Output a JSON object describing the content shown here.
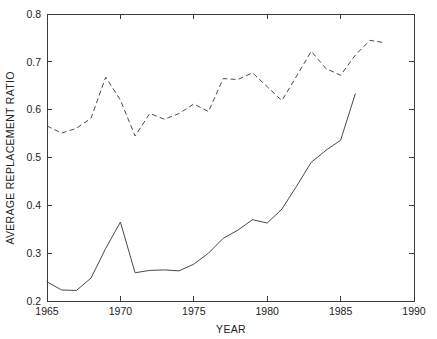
{
  "chart_data": {
    "type": "line",
    "title": "",
    "xlabel": "YEAR",
    "ylabel": "AVERAGE REPLACEMENT RATIO",
    "xlim": [
      1965,
      1990
    ],
    "ylim": [
      0.2,
      0.8
    ],
    "grid": false,
    "legend": null,
    "xticks": [
      1965,
      1970,
      1975,
      1980,
      1985,
      1990
    ],
    "xtick_labels": [
      "1965",
      "1970",
      "1975",
      "1980",
      "1985",
      "1990"
    ],
    "yticks": [
      0.2,
      0.3,
      0.4,
      0.5,
      0.6,
      0.7,
      0.8
    ],
    "ytick_labels": [
      "0.2",
      "0.3",
      "0.4",
      "0.5",
      "0.6",
      "0.7",
      "0.8"
    ],
    "series": [
      {
        "name": "solid-series",
        "style": "solid",
        "color": "#4a4a4a",
        "x": [
          1965,
          1966,
          1967,
          1968,
          1969,
          1970,
          1971,
          1972,
          1973,
          1974,
          1975,
          1976,
          1977,
          1978,
          1979,
          1980,
          1981,
          1982,
          1983,
          1984,
          1985,
          1986
        ],
        "values": [
          0.24,
          0.223,
          0.222,
          0.248,
          0.31,
          0.365,
          0.259,
          0.264,
          0.265,
          0.263,
          0.277,
          0.3,
          0.331,
          0.348,
          0.37,
          0.363,
          0.392,
          0.44,
          0.49,
          0.515,
          0.536,
          0.633
        ]
      },
      {
        "name": "dashed-series",
        "style": "dashed",
        "color": "#4a4a4a",
        "x": [
          1965,
          1966,
          1967,
          1968,
          1969,
          1970,
          1971,
          1972,
          1973,
          1974,
          1975,
          1976,
          1977,
          1978,
          1979,
          1980,
          1981,
          1982,
          1983,
          1984,
          1985,
          1986,
          1987,
          1988
        ],
        "values": [
          0.566,
          0.551,
          0.561,
          0.582,
          0.668,
          0.62,
          0.545,
          0.592,
          0.58,
          0.592,
          0.612,
          0.596,
          0.665,
          0.663,
          0.677,
          0.648,
          0.619,
          0.67,
          0.722,
          0.686,
          0.672,
          0.714,
          0.745,
          0.74
        ]
      }
    ]
  },
  "axis": {
    "x_title": "YEAR",
    "y_title": "AVERAGE REPLACEMENT RATIO"
  }
}
